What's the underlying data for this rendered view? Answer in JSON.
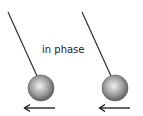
{
  "diagram": {
    "label": "in phase",
    "colors": {
      "string": "#222222",
      "ball_light": "#f2f2f2",
      "ball_mid": "#9a9a9a",
      "ball_dark": "#555555",
      "arrow": "#111111",
      "text": "#222222"
    },
    "pendulums": [
      {
        "name": "left",
        "pivot": [
          8,
          12
        ],
        "bob": [
          41,
          88
        ],
        "radius": 13,
        "arrow_direction": "left"
      },
      {
        "name": "right",
        "pivot": [
          82,
          12
        ],
        "bob": [
          115,
          88
        ],
        "radius": 13,
        "arrow_direction": "left"
      }
    ]
  }
}
